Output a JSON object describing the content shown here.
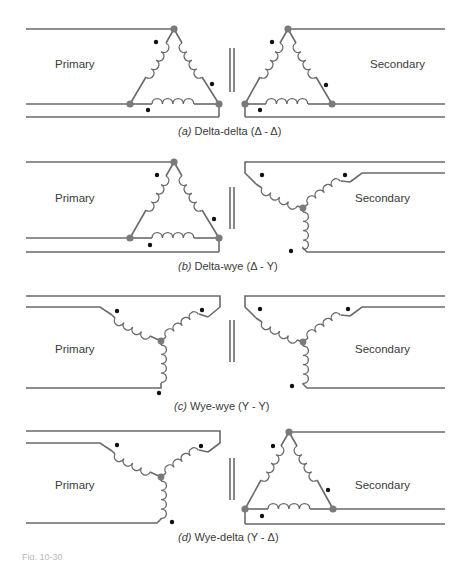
{
  "figure": {
    "panels": [
      {
        "id": "a",
        "tag": "(a)",
        "caption": "Delta-delta (Δ - Δ)",
        "primary_label": "Primary",
        "secondary_label": "Secondary",
        "primary_connection": "delta",
        "secondary_connection": "delta"
      },
      {
        "id": "b",
        "tag": "(b)",
        "caption": "Delta-wye (Δ - Y)",
        "primary_label": "Primary",
        "secondary_label": "Secondary",
        "primary_connection": "delta",
        "secondary_connection": "wye"
      },
      {
        "id": "c",
        "tag": "(c)",
        "caption": "Wye-wye (Y - Y)",
        "primary_label": "Primary",
        "secondary_label": "Secondary",
        "primary_connection": "wye",
        "secondary_connection": "wye"
      },
      {
        "id": "d",
        "tag": "(d)",
        "caption": "Wye-delta (Y - Δ)",
        "primary_label": "Primary",
        "secondary_label": "Secondary",
        "primary_connection": "wye",
        "secondary_connection": "delta"
      }
    ],
    "figure_ref": "Fig. 10-30"
  },
  "colors": {
    "wire": "#6a6a6a",
    "node": "#7a7a7a",
    "polarity_dot": "#111111",
    "text": "#3a3a3a"
  }
}
